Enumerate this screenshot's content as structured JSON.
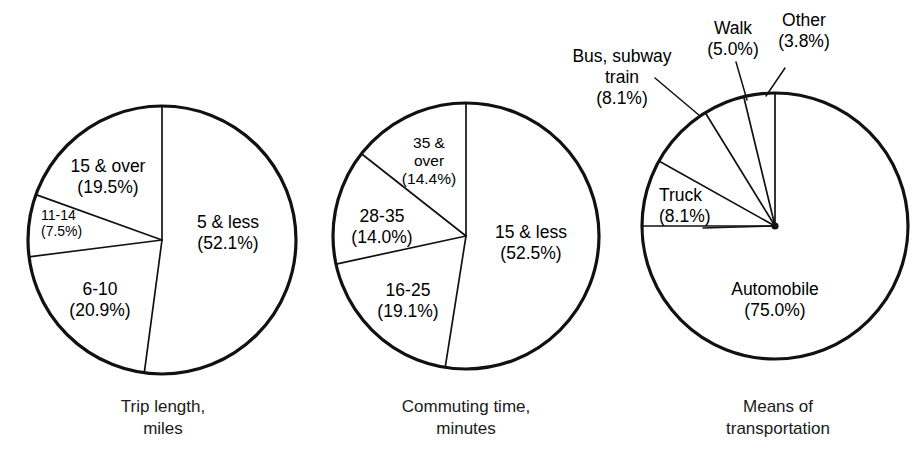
{
  "figure": {
    "background": "#ffffff",
    "ink": "#111111",
    "width": 918,
    "height": 471
  },
  "charts": [
    {
      "id": "trip-length",
      "type": "pie",
      "caption_line1": "Trip length,",
      "caption_line2": "miles",
      "center": {
        "x": 162,
        "y": 240
      },
      "radius": 134,
      "categories": [
        "5 & less",
        "6-10",
        "11-14",
        "15 & over"
      ],
      "values": [
        52.1,
        20.9,
        7.5,
        19.5
      ],
      "value_labels": [
        "(52.1%)",
        "(20.9%)",
        "(7.5%)",
        "(19.5%)"
      ],
      "slices": [
        {
          "name": "5 & less",
          "percent": 52.1,
          "label_line1": "5 & less",
          "label_line2": "(52.1%)",
          "label_x": 228,
          "label_y": 228,
          "label_size": "normal",
          "anchor": "middle",
          "start_deg": 0,
          "end_deg": 187.6
        },
        {
          "name": "6-10",
          "percent": 20.9,
          "label_line1": "6-10",
          "label_line2": "(20.9%)",
          "label_x": 100,
          "label_y": 295,
          "label_size": "normal",
          "anchor": "middle",
          "start_deg": 187.6,
          "end_deg": 262.8
        },
        {
          "name": "11-14",
          "percent": 7.5,
          "label_line1": "11-14",
          "label_line2": "(7.5%)",
          "label_x": 41,
          "label_y": 220,
          "label_size": "small",
          "anchor": "start",
          "start_deg": 262.8,
          "end_deg": 289.8
        },
        {
          "name": "15 & over",
          "percent": 19.5,
          "label_line1": "15 & over",
          "label_line2": "(19.5%)",
          "label_x": 108,
          "label_y": 172,
          "label_size": "normal",
          "anchor": "middle",
          "start_deg": 289.8,
          "end_deg": 360
        }
      ]
    },
    {
      "id": "commuting-time",
      "type": "pie",
      "caption_line1": "Commuting time,",
      "caption_line2": "minutes",
      "center": {
        "x": 466,
        "y": 236
      },
      "radius": 133,
      "categories": [
        "15 & less",
        "16-25",
        "28-35",
        "35 & over"
      ],
      "values": [
        52.5,
        19.1,
        14.0,
        14.4
      ],
      "value_labels": [
        "(52.5%)",
        "(19.1%)",
        "(14.0%)",
        "(14.4%)"
      ],
      "slices": [
        {
          "name": "15 & less",
          "percent": 52.5,
          "label_line1": "15 & less",
          "label_line2": "(52.5%)",
          "label_x": 531,
          "label_y": 238,
          "label_size": "normal",
          "anchor": "middle",
          "start_deg": 0,
          "end_deg": 189.0
        },
        {
          "name": "16-25",
          "percent": 19.1,
          "label_line1": "16-25",
          "label_line2": "(19.1%)",
          "label_x": 408,
          "label_y": 296,
          "label_size": "normal",
          "anchor": "middle",
          "start_deg": 189.0,
          "end_deg": 257.8
        },
        {
          "name": "28-35",
          "percent": 14.0,
          "label_line1": "28-35",
          "label_line2": "(14.0%)",
          "label_x": 382,
          "label_y": 222,
          "label_size": "normal",
          "anchor": "middle",
          "start_deg": 257.8,
          "end_deg": 308.2
        },
        {
          "name": "35 & over",
          "percent": 14.4,
          "label_line1": "35 &",
          "label_line2": "over",
          "label_line3": "(14.4%)",
          "label_x": 429,
          "label_y": 148,
          "label_size": "mid",
          "anchor": "middle",
          "start_deg": 308.2,
          "end_deg": 360
        }
      ]
    },
    {
      "id": "means-of-transportation",
      "type": "pie",
      "caption_line1": "Means of",
      "caption_line2": "transportation",
      "center": {
        "x": 775,
        "y": 226
      },
      "radius": 133,
      "categories": [
        "Automobile",
        "Truck",
        "Bus, subway train",
        "Walk",
        "Other"
      ],
      "values": [
        75.0,
        8.1,
        8.1,
        5.0,
        3.8
      ],
      "value_labels": [
        "(75.0%)",
        "(8.1%)",
        "(8.1%)",
        "(5.0%)",
        "(3.8%)"
      ],
      "slices": [
        {
          "name": "Automobile",
          "percent": 75.0,
          "label_line1": "Automobile",
          "label_line2": "(75.0%)",
          "label_x": 775,
          "label_y": 295,
          "label_size": "normal",
          "anchor": "middle",
          "start_deg": 0,
          "end_deg": 270.0,
          "leader": null
        },
        {
          "name": "Truck",
          "percent": 8.1,
          "label_line1": "Truck",
          "label_line2": "(8.1%)",
          "label_x": 659,
          "label_y": 201,
          "label_size": "normal",
          "anchor": "start",
          "start_deg": 270.0,
          "end_deg": 299.2,
          "leader": {
            "x1": 703,
            "y1": 228,
            "x2": 775,
            "y2": 226
          }
        },
        {
          "name": "Bus, subway train",
          "percent": 8.1,
          "label_line1": "Bus, subway",
          "label_line2": "train",
          "label_line3": "(8.1%)",
          "label_x": 622,
          "label_y": 62,
          "label_size": "normal",
          "anchor": "middle",
          "start_deg": 299.2,
          "end_deg": 328.4,
          "leader": {
            "x1": 655,
            "y1": 78,
            "x2": 700,
            "y2": 116
          }
        },
        {
          "name": "Walk",
          "percent": 5.0,
          "label_line1": "Walk",
          "label_line2": "(5.0%)",
          "label_x": 733,
          "label_y": 34,
          "label_size": "normal",
          "anchor": "middle",
          "start_deg": 328.4,
          "end_deg": 346.4,
          "leader": {
            "x1": 736,
            "y1": 62,
            "x2": 747,
            "y2": 100
          }
        },
        {
          "name": "Other",
          "percent": 3.8,
          "label_line1": "Other",
          "label_line2": "(3.8%)",
          "label_x": 804,
          "label_y": 26,
          "label_size": "normal",
          "anchor": "middle",
          "start_deg": 346.4,
          "end_deg": 360,
          "leader": {
            "x1": 785,
            "y1": 68,
            "x2": 766,
            "y2": 96
          }
        }
      ]
    }
  ],
  "captions": [
    {
      "line1": "Trip length,",
      "line2": "miles",
      "x": 163,
      "y": 412
    },
    {
      "line1": "Commuting time,",
      "line2": "minutes",
      "x": 466,
      "y": 412
    },
    {
      "line1": "Means of",
      "line2": "transportation",
      "x": 778,
      "y": 412
    }
  ]
}
